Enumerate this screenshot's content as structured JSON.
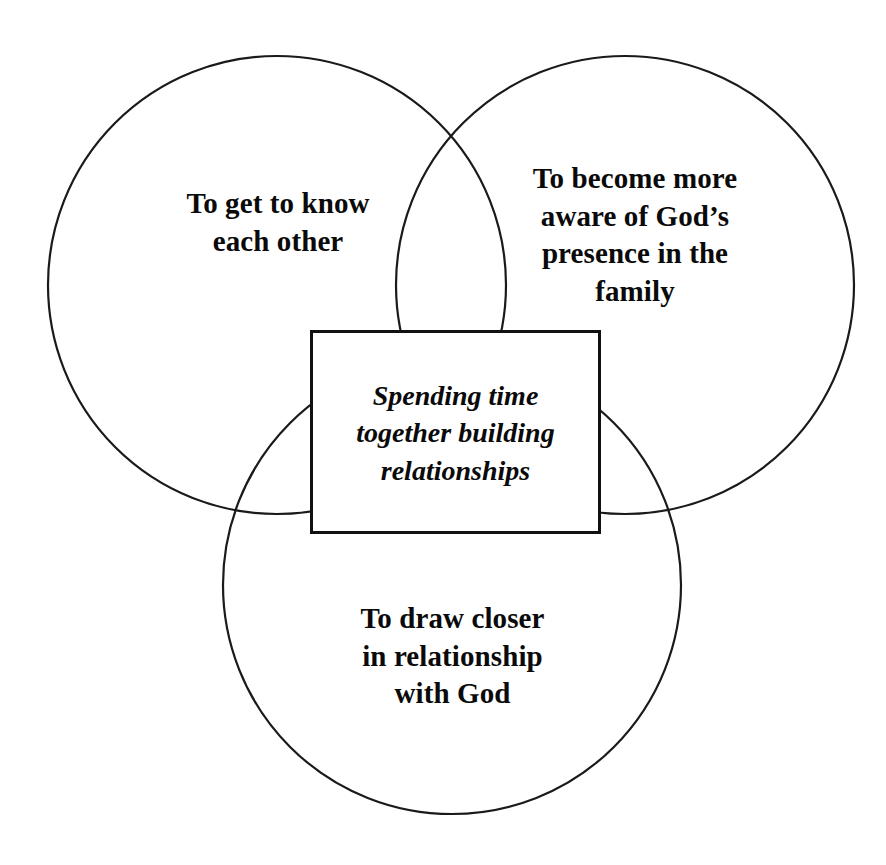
{
  "diagram": {
    "type": "venn-3-circle-with-center-box",
    "background_color": "#ffffff",
    "stroke_color": "#1a1a1a",
    "text_color": "#0a0a0a",
    "circles": [
      {
        "id": "top-left",
        "label": "To get to know\neach other",
        "cx": 277,
        "cy": 285,
        "r": 229
      },
      {
        "id": "top-right",
        "label": "To become more\naware of God’s\npresence in the\nfamily",
        "cx": 625,
        "cy": 285,
        "r": 229
      },
      {
        "id": "bottom",
        "label": "To draw closer\nin relationship\nwith God",
        "cx": 452,
        "cy": 585,
        "r": 229
      }
    ],
    "center_box": {
      "label": "Spending time\ntogether building\nrelationships",
      "x": 310,
      "y": 330,
      "width": 291,
      "height": 204,
      "fill": "#ffffff",
      "border_color": "#111111"
    }
  }
}
